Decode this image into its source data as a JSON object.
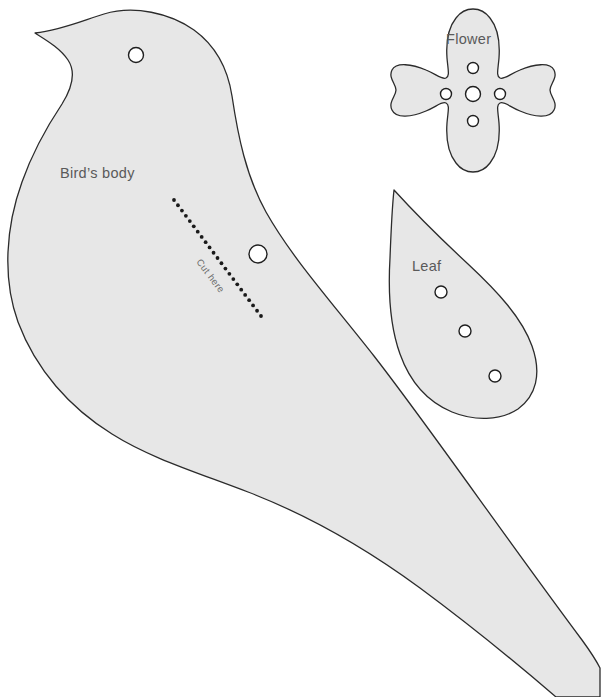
{
  "page": {
    "background_color": "#ffffff",
    "width": 601,
    "height": 697
  },
  "style": {
    "piece_fill": "#e7e7e7",
    "piece_outline": "#2b2b2b",
    "hole_fill": "#ffffff",
    "hole_outline": "#1f1f1f",
    "label_color": "#5a5a5a",
    "cut_label_color": "#6b6b6b",
    "dot_color": "#1a1a1a"
  },
  "pieces": [
    {
      "id": "bird-body",
      "label": "Bird’s body",
      "label_x": 60,
      "label_y": 178,
      "holes": [
        {
          "name": "eye-hole",
          "cx": 136,
          "cy": 55,
          "r": 7.5
        },
        {
          "name": "body-hole",
          "cx": 258,
          "cy": 254,
          "r": 9.0
        }
      ]
    },
    {
      "id": "flower",
      "label": "Flower",
      "label_x": 446,
      "label_y": 44,
      "holes": [
        {
          "name": "flower-center-hole",
          "cx": 473,
          "cy": 94,
          "r": 7.5
        },
        {
          "name": "flower-top-hole",
          "cx": 473,
          "cy": 68,
          "r": 5.5
        },
        {
          "name": "flower-bottom-hole",
          "cx": 473,
          "cy": 121,
          "r": 5.5
        },
        {
          "name": "flower-left-hole",
          "cx": 446,
          "cy": 94,
          "r": 5.5
        },
        {
          "name": "flower-right-hole",
          "cx": 500,
          "cy": 94,
          "r": 5.5
        }
      ]
    },
    {
      "id": "leaf",
      "label": "Leaf",
      "label_x": 412,
      "label_y": 271,
      "holes": [
        {
          "name": "leaf-hole-1",
          "cx": 441,
          "cy": 292,
          "r": 6.0
        },
        {
          "name": "leaf-hole-2",
          "cx": 465,
          "cy": 331,
          "r": 6.0
        },
        {
          "name": "leaf-hole-3",
          "cx": 495,
          "cy": 376,
          "r": 6.0
        }
      ]
    }
  ],
  "cut_line": {
    "label": "Cut here",
    "label_x": 196,
    "label_y": 262,
    "label_rotation": 53,
    "start_x": 174,
    "start_y": 200,
    "end_x": 261,
    "end_y": 316,
    "dot_count": 23,
    "dot_radius": 1.9
  }
}
